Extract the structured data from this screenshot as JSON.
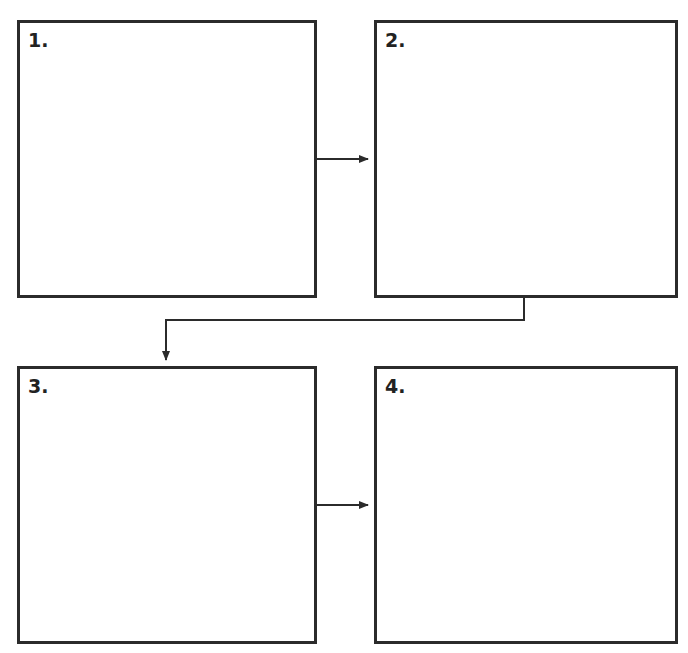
{
  "diagram": {
    "type": "flow-sequence",
    "stroke_color": "#2b2b2b",
    "background": "#ffffff",
    "panels": [
      {
        "id": 1,
        "label": "1.",
        "content": ""
      },
      {
        "id": 2,
        "label": "2.",
        "content": ""
      },
      {
        "id": 3,
        "label": "3.",
        "content": ""
      },
      {
        "id": 4,
        "label": "4.",
        "content": ""
      }
    ],
    "arrows": [
      {
        "from": 1,
        "to": 2,
        "direction": "right"
      },
      {
        "from": 2,
        "to": 3,
        "direction": "elbow-down-left"
      },
      {
        "from": 3,
        "to": 4,
        "direction": "right"
      }
    ]
  }
}
